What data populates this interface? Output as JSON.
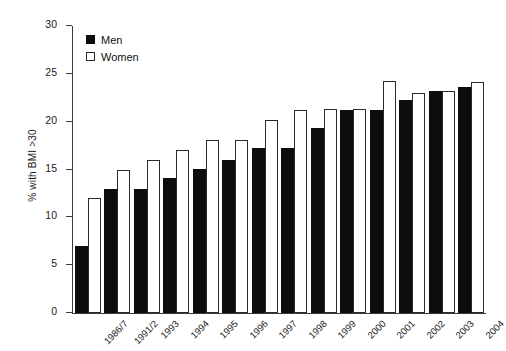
{
  "chart_data": {
    "type": "bar",
    "title": "",
    "subtitle": "",
    "xlabel": "",
    "ylabel": "% with BMI >30",
    "ylim": [
      0,
      30
    ],
    "yticks": [
      0,
      5,
      10,
      15,
      20,
      25,
      30
    ],
    "grid": false,
    "legend_position": "top-left",
    "categories": [
      "1986/7",
      "1991/2",
      "1993",
      "1994",
      "1995",
      "1996",
      "1997",
      "1998",
      "1999",
      "2000",
      "2001",
      "2002",
      "2003",
      "2004"
    ],
    "series": [
      {
        "name": "Men",
        "color": "#0d0d0d",
        "values": [
          7.0,
          13.0,
          13.0,
          14.1,
          15.1,
          16.0,
          17.2,
          17.2,
          19.3,
          21.2,
          21.2,
          22.3,
          23.2,
          23.6
        ]
      },
      {
        "name": "Women",
        "color": "#ffffff",
        "values": [
          12.0,
          15.0,
          16.0,
          17.0,
          18.1,
          18.1,
          20.2,
          21.2,
          21.3,
          21.3,
          24.3,
          23.0,
          23.2,
          24.2
        ]
      }
    ]
  },
  "legend": {
    "items": [
      {
        "label": "Men",
        "style": "filled"
      },
      {
        "label": "Women",
        "style": "outline"
      }
    ]
  },
  "axes": {
    "y_label": "% with BMI >30",
    "y_tick_labels": [
      "0",
      "5",
      "10",
      "15",
      "20",
      "25",
      "30"
    ]
  }
}
